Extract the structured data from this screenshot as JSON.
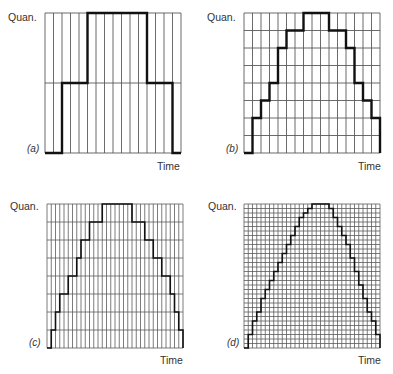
{
  "figure": {
    "y_label": "Quan.",
    "x_label": "Time",
    "grid_color": "#5a5a5a",
    "line_color": "#111111"
  },
  "panels": [
    {
      "tag": "(a)",
      "box": {
        "x": 45,
        "y": 13,
        "w": 136,
        "h": 140
      },
      "columns": 16,
      "rows": 2,
      "levels": [
        0,
        0,
        1,
        1,
        1,
        2,
        2,
        2,
        2,
        2,
        2,
        2,
        1,
        1,
        1,
        0
      ]
    },
    {
      "tag": "(b)",
      "box": {
        "x": 244,
        "y": 13,
        "w": 136,
        "h": 140
      },
      "columns": 16,
      "rows": 8,
      "levels": [
        0,
        2,
        3,
        4,
        6,
        7,
        7,
        8,
        8,
        8,
        7,
        7,
        6,
        4,
        3,
        2
      ]
    },
    {
      "tag": "(c)",
      "box": {
        "x": 47,
        "y": 204,
        "w": 136,
        "h": 144
      },
      "columns": 32,
      "rows": 8,
      "levels": [
        0,
        1,
        2,
        3,
        3,
        4,
        4,
        5,
        6,
        6,
        7,
        7,
        7,
        8,
        8,
        8,
        8,
        8,
        8,
        8,
        7,
        7,
        7,
        6,
        6,
        5,
        5,
        4,
        4,
        3,
        2,
        1
      ]
    },
    {
      "tag": "(d)",
      "box": {
        "x": 244,
        "y": 204,
        "w": 136,
        "h": 144
      },
      "columns": 32,
      "rows": 32,
      "levels": [
        0,
        3,
        6,
        8,
        11,
        13,
        15,
        17,
        19,
        21,
        23,
        25,
        27,
        29,
        30,
        31,
        32,
        32,
        32,
        32,
        31,
        29,
        27,
        25,
        23,
        20,
        17,
        14,
        11,
        8,
        6,
        3
      ]
    }
  ],
  "labels": [
    {
      "panel": 0,
      "quan": {
        "x": 8,
        "y": 11
      },
      "tag": {
        "x": 27,
        "y": 143
      },
      "time": {
        "x": 157,
        "y": 160
      }
    },
    {
      "panel": 1,
      "quan": {
        "x": 207,
        "y": 11
      },
      "tag": {
        "x": 226,
        "y": 143
      },
      "time": {
        "x": 358,
        "y": 160
      }
    },
    {
      "panel": 2,
      "quan": {
        "x": 10,
        "y": 200
      },
      "tag": {
        "x": 29,
        "y": 337
      },
      "time": {
        "x": 160,
        "y": 354
      }
    },
    {
      "panel": 3,
      "quan": {
        "x": 208,
        "y": 200
      },
      "tag": {
        "x": 227,
        "y": 337
      },
      "time": {
        "x": 358,
        "y": 354
      }
    }
  ],
  "chart_data": [
    {
      "type": "line",
      "title": "(a)",
      "xlabel": "Time",
      "ylabel": "Quan.",
      "x": [
        0,
        1,
        2,
        3,
        4,
        5,
        6,
        7,
        8,
        9,
        10,
        11,
        12,
        13,
        14,
        15
      ],
      "values": [
        0,
        0,
        1,
        1,
        1,
        2,
        2,
        2,
        2,
        2,
        2,
        2,
        1,
        1,
        1,
        0
      ],
      "ylim": [
        0,
        2
      ],
      "grid": true,
      "note": "step plot, 16 samples, 2 quantization levels"
    },
    {
      "type": "line",
      "title": "(b)",
      "xlabel": "Time",
      "ylabel": "Quan.",
      "x": [
        0,
        1,
        2,
        3,
        4,
        5,
        6,
        7,
        8,
        9,
        10,
        11,
        12,
        13,
        14,
        15
      ],
      "values": [
        0,
        2,
        3,
        4,
        6,
        7,
        7,
        8,
        8,
        8,
        7,
        7,
        6,
        4,
        3,
        2
      ],
      "ylim": [
        0,
        8
      ],
      "grid": true,
      "note": "step plot, 16 samples, 8 quantization levels"
    },
    {
      "type": "line",
      "title": "(c)",
      "xlabel": "Time",
      "ylabel": "Quan.",
      "values": [
        0,
        1,
        2,
        3,
        3,
        4,
        4,
        5,
        6,
        6,
        7,
        7,
        7,
        8,
        8,
        8,
        8,
        8,
        8,
        8,
        7,
        7,
        7,
        6,
        6,
        5,
        5,
        4,
        4,
        3,
        2,
        1
      ],
      "ylim": [
        0,
        8
      ],
      "grid": true,
      "note": "step plot, 32 samples, 8 quantization levels"
    },
    {
      "type": "line",
      "title": "(d)",
      "xlabel": "Time",
      "ylabel": "Quan.",
      "values": [
        0,
        3,
        6,
        8,
        11,
        13,
        15,
        17,
        19,
        21,
        23,
        25,
        27,
        29,
        30,
        31,
        32,
        32,
        32,
        32,
        31,
        29,
        27,
        25,
        23,
        20,
        17,
        14,
        11,
        8,
        6,
        3
      ],
      "ylim": [
        0,
        32
      ],
      "grid": true,
      "note": "step plot, 32 samples, 32 quantization levels"
    }
  ]
}
